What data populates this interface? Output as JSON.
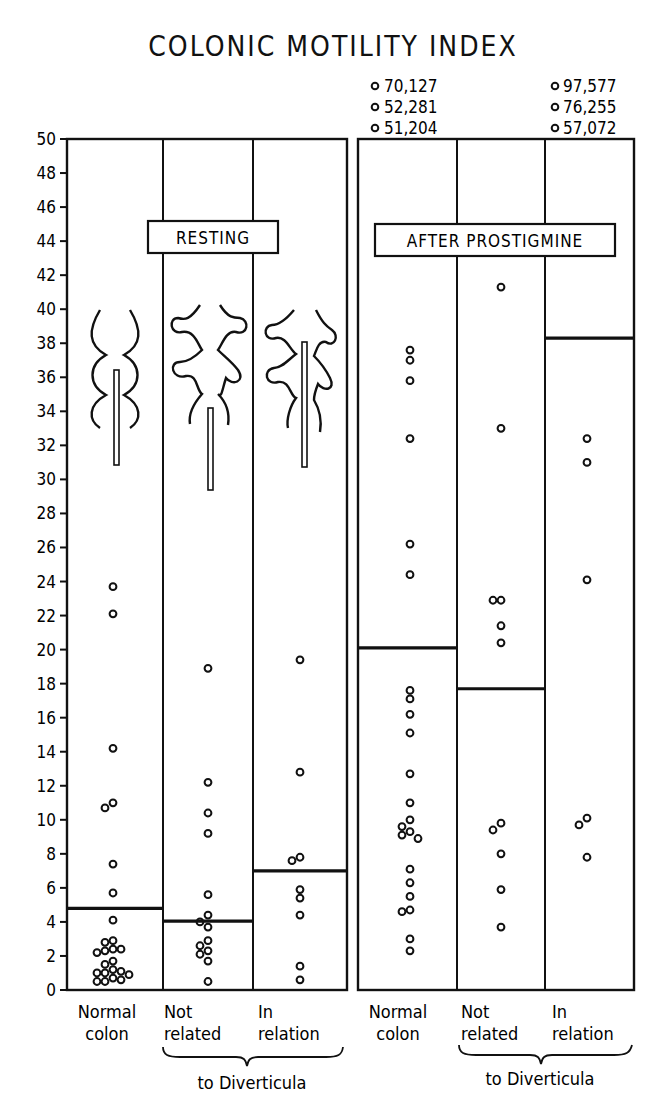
{
  "chart_data": {
    "type": "scatter",
    "title": "COLONIC MOTILITY INDEX",
    "ylabel": "",
    "xlabel": "",
    "ylim": [
      0,
      50
    ],
    "yticks": [
      0,
      2,
      4,
      6,
      8,
      10,
      12,
      14,
      16,
      18,
      20,
      22,
      24,
      26,
      28,
      30,
      32,
      34,
      36,
      38,
      40,
      42,
      44,
      46,
      48,
      50
    ],
    "grid": false,
    "legend": null,
    "panels": [
      {
        "label": "RESTING",
        "group_caption": "to Diverticula"
      },
      {
        "label": "AFTER PROSTIGMINE",
        "group_caption": "to Diverticula"
      }
    ],
    "series": [
      {
        "name": "Resting - Normal colon",
        "panel": "RESTING",
        "category": "Normal colon",
        "mean": 4.8,
        "values": [
          23.7,
          22.1,
          14.2,
          11.0,
          10.7,
          7.4,
          5.7,
          4.1,
          2.9,
          2.8,
          2.4,
          2.4,
          2.3,
          2.2,
          1.7,
          1.5,
          1.2,
          1.1,
          1.0,
          1.0,
          0.9,
          0.7,
          0.6,
          0.5,
          0.5
        ]
      },
      {
        "name": "Resting - Not related to Diverticula",
        "panel": "RESTING",
        "category": "Not related",
        "mean": 4.05,
        "values": [
          18.9,
          12.2,
          10.4,
          9.2,
          5.6,
          4.4,
          4.0,
          3.7,
          2.9,
          2.6,
          2.3,
          2.1,
          1.7,
          0.5
        ]
      },
      {
        "name": "Resting - In relation to Diverticula",
        "panel": "RESTING",
        "category": "In relation",
        "mean": 7.0,
        "values": [
          19.4,
          12.8,
          7.8,
          7.6,
          5.9,
          5.4,
          4.4,
          1.4,
          0.6
        ]
      },
      {
        "name": "After Prostigmine - Normal colon",
        "panel": "AFTER PROSTIGMINE",
        "category": "Normal colon",
        "mean": 20.1,
        "values": [
          70.127,
          52.281,
          51.204,
          37.6,
          37.0,
          35.8,
          32.4,
          26.2,
          24.4,
          17.6,
          17.1,
          16.2,
          15.1,
          12.7,
          11.0,
          10.0,
          9.6,
          9.3,
          9.1,
          8.9,
          7.1,
          6.3,
          5.5,
          4.7,
          4.6,
          3.0,
          2.3
        ]
      },
      {
        "name": "After Prostigmine - Not related to Diverticula",
        "panel": "AFTER PROSTIGMINE",
        "category": "Not related",
        "mean": 17.7,
        "values": [
          41.3,
          33.0,
          22.9,
          22.9,
          21.4,
          20.4,
          9.8,
          9.4,
          8.0,
          5.9,
          3.7
        ]
      },
      {
        "name": "After Prostigmine - In relation to Diverticula",
        "panel": "AFTER PROSTIGMINE",
        "category": "In relation",
        "mean": 38.3,
        "values": [
          97.577,
          76.255,
          57.072,
          32.4,
          31.0,
          24.1,
          10.1,
          9.7,
          7.8
        ]
      }
    ],
    "offscale_annotations": [
      {
        "column": "After Prostigmine - Normal colon",
        "values": [
          "70,127",
          "52,281",
          "51,204"
        ]
      },
      {
        "column": "After Prostigmine - In relation",
        "values": [
          "97,577",
          "76,255",
          "57,072"
        ]
      }
    ]
  },
  "labels": {
    "title": "COLONIC  MOTILITY  INDEX",
    "resting_box": "RESTING",
    "prostigmine_box": "AFTER  PROSTIGMINE",
    "col1_line1": "Normal",
    "col1_line2": "colon",
    "col2_line1": "Not",
    "col2_line2": "related",
    "col3_line1": "In",
    "col3_line2": "relation",
    "col4_line1": "Normal",
    "col4_line2": "colon",
    "col5_line1": "Not",
    "col5_line2": "related",
    "col6_line1": "In",
    "col6_line2": "relation",
    "caption_left": "to Diverticula",
    "caption_right": "to Diverticula",
    "outlier_4_1": "70,127",
    "outlier_4_2": "52,281",
    "outlier_4_3": "51,204",
    "outlier_6_1": "97,577",
    "outlier_6_2": "76,255",
    "outlier_6_3": "57,072"
  },
  "colors": {
    "ink": "#111111",
    "background": "#ffffff"
  }
}
